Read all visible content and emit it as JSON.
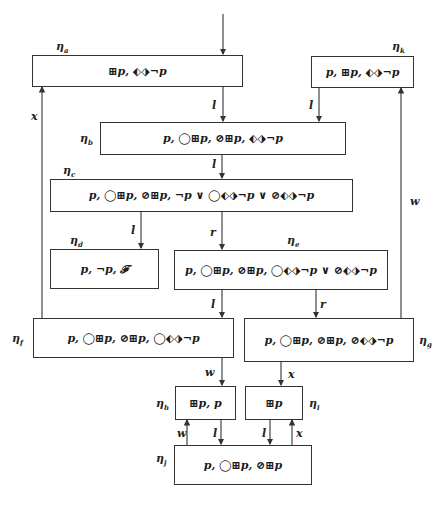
{
  "nodes": {
    "a": {
      "name": "ηa",
      "sub": "a",
      "formula": "⊞p, ⬖⬗¬p"
    },
    "b": {
      "name": "ηb",
      "sub": "b",
      "formula": "p, ◯⊞p, ⊘⊞p, ⬖⬗¬p"
    },
    "c": {
      "name": "ηc",
      "sub": "c",
      "formula": "p, ◯⊞p, ⊘⊞p, ¬p ∨ ◯⬖⬗¬p ∨ ⊘⬖⬗¬p"
    },
    "d": {
      "name": "ηd",
      "sub": "d",
      "formula": "p, ¬p, 𝓕"
    },
    "e": {
      "name": "ηe",
      "sub": "e",
      "formula": "p, ◯⊞p, ⊘⊞p, ◯⬖⬗¬p ∨ ⊘⬖⬗¬p"
    },
    "f": {
      "name": "ηf",
      "sub": "f",
      "formula": "p, ◯⊞p, ⊘⊞p, ◯⬖⬗¬p"
    },
    "g": {
      "name": "ηg",
      "sub": "g",
      "formula": "p, ◯⊞p, ⊘⊞p, ⊘⬖⬗¬p"
    },
    "h": {
      "name": "ηh",
      "sub": "h",
      "formula": "⊞p, p"
    },
    "i": {
      "name": "ηi",
      "sub": "i",
      "formula": "⊞p"
    },
    "j": {
      "name": "ηj",
      "sub": "j",
      "formula": "p, ◯⊞p, ⊘⊞p"
    },
    "k": {
      "name": "ηk",
      "sub": "k",
      "formula": "p, ⊞p, ⬖⬗¬p"
    }
  },
  "edges": [
    {
      "from": "start",
      "to": "a",
      "label": ""
    },
    {
      "from": "a",
      "to": "b",
      "label": "l"
    },
    {
      "from": "k",
      "to": "b",
      "label": "l"
    },
    {
      "from": "b",
      "to": "c",
      "label": "l"
    },
    {
      "from": "c",
      "to": "d",
      "label": "l"
    },
    {
      "from": "c",
      "to": "e",
      "label": "r"
    },
    {
      "from": "e",
      "to": "f",
      "label": "l"
    },
    {
      "from": "e",
      "to": "g",
      "label": "r"
    },
    {
      "from": "f",
      "to": "a",
      "label": "x"
    },
    {
      "from": "g",
      "to": "k",
      "label": "w"
    },
    {
      "from": "f",
      "to": "h",
      "label": "w"
    },
    {
      "from": "g",
      "to": "i",
      "label": "x"
    },
    {
      "from": "h",
      "to": "j",
      "label": "l"
    },
    {
      "from": "j",
      "to": "h",
      "label": "w"
    },
    {
      "from": "i",
      "to": "j",
      "label": "l"
    },
    {
      "from": "j",
      "to": "i",
      "label": "x"
    }
  ],
  "edge_labels": {
    "a_b": "l",
    "k_b": "l",
    "b_c": "l",
    "c_d": "l",
    "c_e": "r",
    "e_f": "l",
    "e_g": "r",
    "f_a": "x",
    "g_k": "w",
    "f_h": "w",
    "g_i": "x",
    "h_j": "l",
    "j_h": "w",
    "i_j": "l",
    "j_i": "x"
  }
}
